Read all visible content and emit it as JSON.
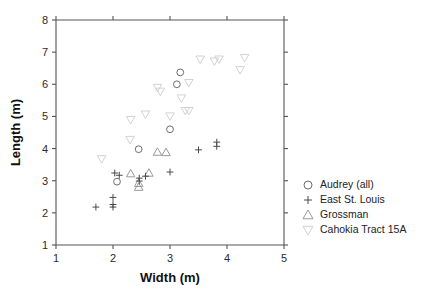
{
  "chart_data": {
    "type": "scatter",
    "title": "",
    "xlabel": "Width (m)",
    "ylabel": "Length (m)",
    "xlim": [
      1,
      5
    ],
    "ylim": [
      1,
      8
    ],
    "xticks": [
      1,
      2,
      3,
      4,
      5
    ],
    "yticks": [
      1,
      2,
      3,
      4,
      5,
      6,
      7,
      8
    ],
    "grid": false,
    "legend_position": "right",
    "series": [
      {
        "name": "Audrey (all)",
        "marker": "circle",
        "color": "#6e6e6e",
        "points": [
          [
            2.07,
            2.97
          ],
          [
            2.45,
            3.98
          ],
          [
            3.0,
            4.6
          ],
          [
            3.12,
            6.0
          ],
          [
            3.18,
            6.37
          ]
        ]
      },
      {
        "name": "East St. Louis",
        "marker": "plus",
        "color": "#4a4a4a",
        "points": [
          [
            1.7,
            2.18
          ],
          [
            2.0,
            2.18
          ],
          [
            2.0,
            2.26
          ],
          [
            2.0,
            2.48
          ],
          [
            2.03,
            3.24
          ],
          [
            2.11,
            3.17
          ],
          [
            2.46,
            2.99
          ],
          [
            2.46,
            3.08
          ],
          [
            2.57,
            3.14
          ],
          [
            3.0,
            3.27
          ],
          [
            3.5,
            3.96
          ],
          [
            3.82,
            4.07
          ],
          [
            3.82,
            4.2
          ]
        ]
      },
      {
        "name": "Grossman",
        "marker": "triangle-up",
        "color": "#9a9a9a",
        "points": [
          [
            2.31,
            3.22
          ],
          [
            2.45,
            2.8
          ],
          [
            2.45,
            2.92
          ],
          [
            2.63,
            3.24
          ],
          [
            2.78,
            3.89
          ],
          [
            2.93,
            3.88
          ]
        ]
      },
      {
        "name": "Cahokia Tract 15A",
        "marker": "triangle-down",
        "color": "#d2d2d2",
        "points": [
          [
            1.8,
            3.68
          ],
          [
            2.3,
            4.28
          ],
          [
            2.31,
            4.9
          ],
          [
            2.57,
            5.07
          ],
          [
            2.78,
            5.9
          ],
          [
            2.83,
            5.78
          ],
          [
            3.0,
            5.01
          ],
          [
            3.2,
            5.57
          ],
          [
            3.27,
            5.18
          ],
          [
            3.33,
            5.18
          ],
          [
            3.33,
            6.05
          ],
          [
            3.53,
            6.78
          ],
          [
            3.78,
            6.72
          ],
          [
            3.86,
            6.78
          ],
          [
            4.23,
            6.45
          ],
          [
            4.31,
            6.83
          ]
        ]
      }
    ]
  },
  "legend": {
    "items": [
      {
        "label": "Audrey (all)",
        "marker": "circle"
      },
      {
        "label": "East St. Louis",
        "marker": "plus"
      },
      {
        "label": "Grossman",
        "marker": "triangle-up"
      },
      {
        "label": "Cahokia Tract 15A",
        "marker": "triangle-down"
      }
    ]
  },
  "caption": ""
}
